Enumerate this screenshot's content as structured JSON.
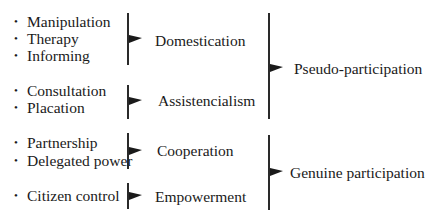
{
  "groups": [
    {
      "items": [
        "Manipulation",
        "Therapy",
        "Informing"
      ],
      "category": "Domestication"
    },
    {
      "items": [
        "Consultation",
        "Placation"
      ],
      "category": "Assistencialism"
    },
    {
      "items": [
        "Partnership",
        "Delegated power"
      ],
      "category": "Cooperation"
    },
    {
      "items": [
        "Citizen control"
      ],
      "category": "Empowerment"
    }
  ],
  "super_groups": [
    {
      "label": "Pseudo-participation",
      "covers": [
        "Domestication",
        "Assistencialism"
      ]
    },
    {
      "label": "Genuine participation",
      "covers": [
        "Cooperation",
        "Empowerment"
      ]
    }
  ],
  "bullet_symbol": "•",
  "colors": {
    "text": "#1a1a1a",
    "lines": "#2a2a2a",
    "background": "#ffffff"
  }
}
